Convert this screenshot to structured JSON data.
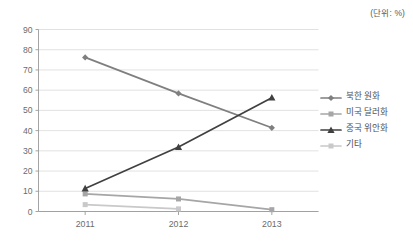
{
  "unit_note": "(단위: %)",
  "legend": {
    "position": "right",
    "items": [
      {
        "label": "북한 원화",
        "color": "#7f7f7f",
        "marker": "diamond-marker"
      },
      {
        "label": "미국 달러화",
        "color": "#a6a6a6",
        "marker": "square-marker"
      },
      {
        "label": "중국 위안화",
        "color": "#404040",
        "marker": "triangle-marker"
      },
      {
        "label": "기타",
        "color": "#c9c9c9",
        "marker": "square-marker"
      }
    ]
  },
  "axes": {
    "y_ticks": [
      "0",
      "10",
      "20",
      "30",
      "40",
      "50",
      "60",
      "70",
      "80",
      "90"
    ],
    "x_ticks": [
      "2011",
      "2012",
      "2013"
    ]
  },
  "chart_data": {
    "type": "line",
    "title": "",
    "subtitle": "",
    "xlabel": "",
    "ylabel": "",
    "unit": "%",
    "unit_note": "(단위: %)",
    "categories": [
      "2011",
      "2012",
      "2013"
    ],
    "ylim": [
      0,
      90
    ],
    "ytick_step": 10,
    "grid": "horizontal",
    "legend_position": "right",
    "series": [
      {
        "name": "북한 원화",
        "values": [
          76.2,
          58.4,
          41.4
        ],
        "color": "#7f7f7f",
        "marker": "diamond"
      },
      {
        "name": "미국 달러화",
        "values": [
          8.7,
          6.2,
          0.9
        ],
        "color": "#a6a6a6",
        "marker": "square"
      },
      {
        "name": "중국 위안화",
        "values": [
          11.4,
          31.9,
          56.3
        ],
        "color": "#404040",
        "marker": "triangle"
      },
      {
        "name": "기타",
        "values": [
          3.4,
          1.3,
          null
        ],
        "color": "#c9c9c9",
        "marker": "square"
      }
    ]
  }
}
